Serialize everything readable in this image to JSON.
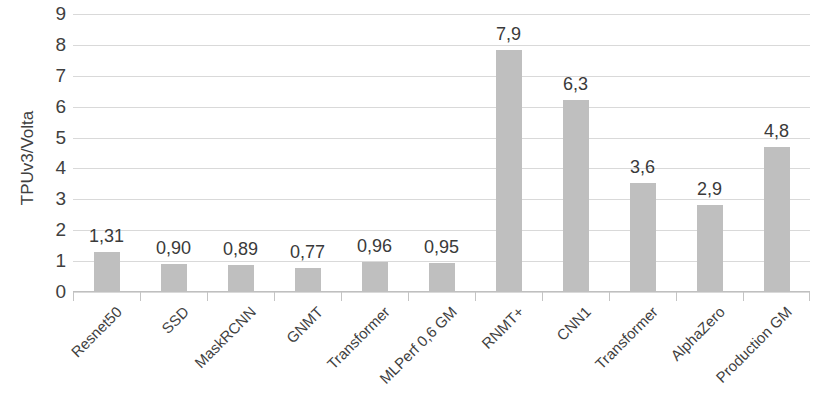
{
  "chart_data": {
    "type": "bar",
    "title": "",
    "subtitle": "",
    "xlabel": "",
    "ylabel": "TPUv3/Volta",
    "ylim": [
      0,
      9
    ],
    "ytick_step": 1,
    "yticks": [
      "9",
      "8",
      "7",
      "6",
      "5",
      "4",
      "3",
      "2",
      "1",
      "0"
    ],
    "grid": true,
    "legend": "none",
    "orientation": "vertical",
    "bar_color": "#bfbfbf",
    "gridline_color": "#d9d9d9",
    "categories": [
      "Resnet50",
      "SSD",
      "MaskRCNN",
      "GNMT",
      "Transformer",
      "MLPerf 0,6 GM",
      "RNMT+",
      "CNN1",
      "Transformer",
      "AlphaZero",
      "Production GM"
    ],
    "values": [
      1.31,
      0.9,
      0.89,
      0.77,
      0.96,
      0.95,
      7.9,
      6.3,
      3.6,
      2.9,
      4.8
    ],
    "value_labels": [
      "1,31",
      "0,90",
      "0,89",
      "0,77",
      "0,96",
      "0,95",
      "7,9",
      "6,3",
      "3,6",
      "2,9",
      "4,8"
    ],
    "bar_plot_heights": [
      1.31,
      0.9,
      0.89,
      0.77,
      0.96,
      0.95,
      7.82,
      6.22,
      3.52,
      2.82,
      4.68
    ]
  }
}
